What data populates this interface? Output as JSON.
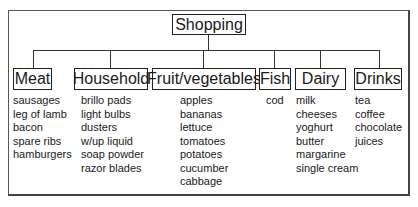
{
  "root": {
    "label": "Shopping"
  },
  "categories": [
    {
      "label": "Meat",
      "items": [
        "sausages",
        "leg of lamb",
        "bacon",
        "spare ribs",
        "hamburgers"
      ]
    },
    {
      "label": "Household",
      "items": [
        "brillo pads",
        "light bulbs",
        "dusters",
        "w/up liquid",
        "soap powder",
        "razor blades"
      ]
    },
    {
      "label": "Fruit/vegetables",
      "items": [
        "apples",
        "bananas",
        "lettuce",
        "tomatoes",
        "potatoes",
        "cucumber",
        "cabbage"
      ]
    },
    {
      "label": "Fish",
      "items": [
        "cod"
      ]
    },
    {
      "label": "Dairy",
      "items": [
        "milk",
        "cheeses",
        "yoghurt",
        "butter",
        "margarine",
        "single cream"
      ]
    },
    {
      "label": "Drinks",
      "items": [
        "tea",
        "coffee",
        "chocolate",
        "juices"
      ]
    }
  ]
}
